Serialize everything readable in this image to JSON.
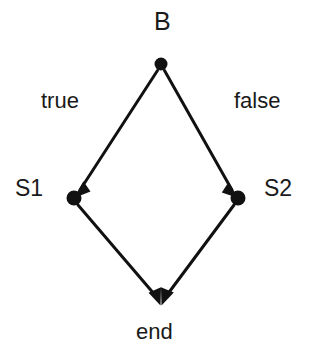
{
  "diagram": {
    "type": "flow-graph",
    "canvas": {
      "width": 311,
      "height": 355,
      "background": "#ffffff"
    },
    "stroke_color": "#111111",
    "node_color": "#111111",
    "text_color": "#1a1a1a",
    "nodes": [
      {
        "id": "B",
        "label": "B",
        "cx": 161,
        "cy": 64,
        "r": 6.5,
        "label_x": 154,
        "label_y": 9
      },
      {
        "id": "S1",
        "label": "S1",
        "cx": 74,
        "cy": 198,
        "r": 7.5,
        "label_x": 15,
        "label_y": 177
      },
      {
        "id": "S2",
        "label": "S2",
        "cx": 238,
        "cy": 198,
        "r": 7.5,
        "label_x": 264,
        "label_y": 177
      },
      {
        "id": "end",
        "label": "end",
        "cx": 161,
        "cy": 305,
        "r": 0,
        "label_x": 136,
        "label_y": 321
      }
    ],
    "edges": [
      {
        "id": "b-to-s1",
        "from": "B",
        "to": "S1",
        "label": "true",
        "label_x": 41,
        "label_y": 90,
        "arrow": true
      },
      {
        "id": "b-to-s2",
        "from": "B",
        "to": "S2",
        "label": "false",
        "label_x": 234,
        "label_y": 90,
        "arrow": true
      },
      {
        "id": "s1-to-end",
        "from": "S1",
        "to": "end",
        "label": "",
        "arrow": true
      },
      {
        "id": "s2-to-end",
        "from": "S2",
        "to": "end",
        "label": "",
        "arrow": true
      }
    ],
    "edge_labels": {
      "true": "true",
      "false": "false"
    },
    "node_labels": {
      "b": "B",
      "s1": "S1",
      "s2": "S2",
      "end": "end"
    }
  }
}
